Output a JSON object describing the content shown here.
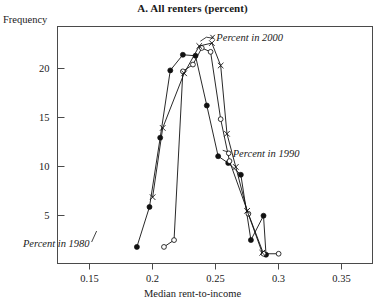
{
  "chart_data": {
    "type": "line",
    "title": "A. All renters (percent)",
    "xlabel": "Median rent-to-income",
    "ylabel": "Frequency",
    "xlim": [
      0.125,
      0.375
    ],
    "ylim": [
      0,
      24.3
    ],
    "grid": false,
    "legend_position": "inline-annotations",
    "xticks": [
      0.15,
      0.2,
      0.25,
      0.3,
      0.35
    ],
    "xtick_labels": [
      "0.15",
      "0.2",
      "0.25",
      "0.3",
      "0.35"
    ],
    "yticks": [
      5,
      10,
      15,
      20
    ],
    "ytick_labels": [
      "5",
      "10",
      "15",
      "20"
    ],
    "annotations": [
      {
        "text": "Percent in 2000",
        "x": 0.2455,
        "y": 23.2,
        "marker": "x"
      },
      {
        "text": "Percent in 1990",
        "x": 0.2585,
        "y": 11.3,
        "marker": "open-circle"
      },
      {
        "text": "Percent in 1980",
        "x": 0.1505,
        "y": 2.1,
        "marker": "filled-circle"
      }
    ],
    "series": [
      {
        "name": "Percent in 1980",
        "marker": "filled-circle",
        "points": [
          {
            "x": 0.188,
            "y": 1.7
          },
          {
            "x": 0.198,
            "y": 5.8
          },
          {
            "x": 0.2065,
            "y": 12.9
          },
          {
            "x": 0.2145,
            "y": 19.8
          },
          {
            "x": 0.2245,
            "y": 21.4
          },
          {
            "x": 0.2345,
            "y": 21.3
          },
          {
            "x": 0.2435,
            "y": 16.2
          },
          {
            "x": 0.2525,
            "y": 11.0
          },
          {
            "x": 0.2605,
            "y": 10.3
          },
          {
            "x": 0.2705,
            "y": 9.1
          },
          {
            "x": 0.2785,
            "y": 2.4
          },
          {
            "x": 0.2885,
            "y": 4.9
          },
          {
            "x": 0.2905,
            "y": 0.9
          }
        ]
      },
      {
        "name": "Percent in 1990",
        "marker": "open-circle",
        "points": [
          {
            "x": 0.2095,
            "y": 1.7
          },
          {
            "x": 0.2175,
            "y": 2.4
          },
          {
            "x": 0.2245,
            "y": 19.7
          },
          {
            "x": 0.2325,
            "y": 20.4
          },
          {
            "x": 0.2395,
            "y": 22.1
          },
          {
            "x": 0.2465,
            "y": 21.7
          },
          {
            "x": 0.2545,
            "y": 14.8
          },
          {
            "x": 0.2615,
            "y": 10.5
          },
          {
            "x": 0.2765,
            "y": 5.1
          },
          {
            "x": 0.2885,
            "y": 1.0
          },
          {
            "x": 0.3005,
            "y": 1.0
          }
        ]
      },
      {
        "name": "Percent in 2000",
        "marker": "x",
        "points": [
          {
            "x": 0.2005,
            "y": 6.8
          },
          {
            "x": 0.2085,
            "y": 13.9
          },
          {
            "x": 0.2255,
            "y": 19.5
          },
          {
            "x": 0.2375,
            "y": 22.3
          },
          {
            "x": 0.2475,
            "y": 22.6
          },
          {
            "x": 0.2545,
            "y": 20.3
          },
          {
            "x": 0.2595,
            "y": 13.3
          },
          {
            "x": 0.2665,
            "y": 9.9
          },
          {
            "x": 0.2755,
            "y": 5.4
          },
          {
            "x": 0.2875,
            "y": 1.1
          }
        ]
      }
    ]
  }
}
